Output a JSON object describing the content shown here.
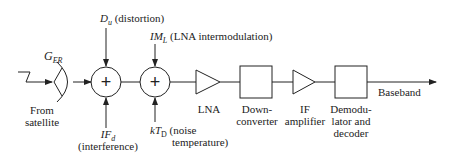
{
  "diagram": {
    "antenna_gain": {
      "symbol": "G",
      "subscript": "ER"
    },
    "source_label": [
      "From",
      "satellite"
    ],
    "distortion": {
      "symbol": "D",
      "subscript": "u",
      "desc": "(distortion)"
    },
    "interference": {
      "symbol": "IF",
      "subscript": "d",
      "desc": "(interference)"
    },
    "intermod": {
      "symbol": "IM",
      "subscript": "L",
      "desc": "(LNA intermodulation)"
    },
    "noise": {
      "symbol": "kT",
      "subscript": "D",
      "desc1": "(noise",
      "desc2": "temperature)"
    },
    "summer_symbol": "+",
    "blocks": {
      "lna": [
        "LNA"
      ],
      "downconverter": [
        "Down-",
        "converter"
      ],
      "if_amp": [
        "IF",
        "amplifier"
      ],
      "demod": [
        "Demodu-",
        "lator and",
        "decoder"
      ]
    },
    "output_label": "Baseband"
  }
}
